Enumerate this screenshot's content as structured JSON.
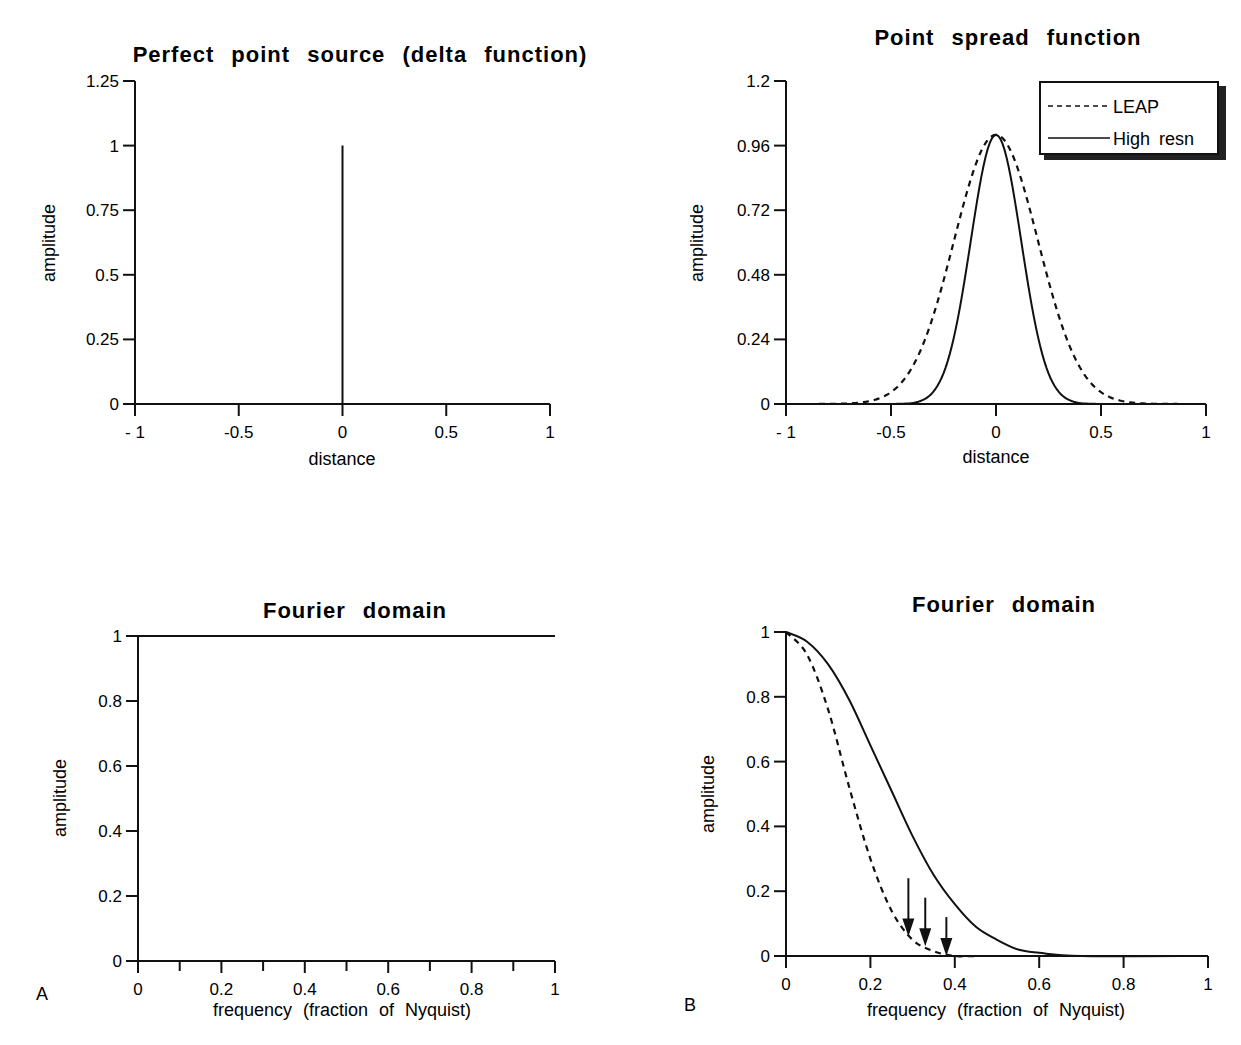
{
  "figure": {
    "panel_labels": [
      "A",
      "B"
    ]
  },
  "chart_data": [
    {
      "id": "A-top",
      "type": "line",
      "title": "Perfect point source (delta function)",
      "xlabel": "distance",
      "ylabel": "amplitude",
      "xlim": [
        -1,
        1
      ],
      "ylim": [
        0,
        1.25
      ],
      "xticks": [
        "- 1",
        "-0.5",
        "0",
        "0.5",
        "1"
      ],
      "yticks": [
        "0",
        "0.25",
        "0.5",
        "0.75",
        "1",
        "1.25"
      ],
      "grid": false,
      "series": [
        {
          "name": "delta",
          "style": "solid",
          "x": [
            -1,
            0,
            0,
            0,
            1
          ],
          "y": [
            0,
            0,
            1,
            0,
            0
          ]
        }
      ]
    },
    {
      "id": "B-top",
      "type": "line",
      "title": "Point spread function",
      "xlabel": "distance",
      "ylabel": "amplitude",
      "xlim": [
        -1,
        1
      ],
      "ylim": [
        0,
        1.2
      ],
      "xticks": [
        "- 1",
        "-0.5",
        "0",
        "0.5",
        "1"
      ],
      "yticks": [
        "0",
        "0.24",
        "0.48",
        "0.72",
        "0.96",
        "1.2"
      ],
      "grid": false,
      "legend": {
        "position": "upper right",
        "entries": [
          {
            "label": "LEAP",
            "style": "dashed"
          },
          {
            "label": "High resn",
            "style": "solid"
          }
        ]
      },
      "series": [
        {
          "name": "LEAP",
          "style": "dashed",
          "gaussian_sigma": 0.2,
          "x": [
            -1,
            -0.6,
            -0.5,
            -0.4,
            -0.3,
            -0.2,
            -0.1,
            0,
            0.1,
            0.2,
            0.3,
            0.4,
            0.5,
            0.6,
            1
          ],
          "y": [
            0,
            0.01,
            0.04,
            0.14,
            0.32,
            0.6,
            0.88,
            1.0,
            0.88,
            0.6,
            0.32,
            0.14,
            0.04,
            0.01,
            0
          ]
        },
        {
          "name": "High resn",
          "style": "solid",
          "gaussian_sigma": 0.12,
          "x": [
            -1,
            -0.4,
            -0.3,
            -0.2,
            -0.1,
            0,
            0.1,
            0.2,
            0.3,
            0.4,
            1
          ],
          "y": [
            0,
            0.0,
            0.04,
            0.25,
            0.7,
            1.0,
            0.7,
            0.25,
            0.04,
            0.0,
            0
          ]
        }
      ]
    },
    {
      "id": "A-bottom",
      "type": "line",
      "title": "Fourier domain",
      "xlabel": "frequency (fraction of Nyquist)",
      "ylabel": "amplitude",
      "xlim": [
        0,
        1
      ],
      "ylim": [
        0,
        1
      ],
      "xticks": [
        "0",
        "0.2",
        "0.4",
        "0.6",
        "0.8",
        "1"
      ],
      "minor_xticks": [
        0.1,
        0.3,
        0.5,
        0.7,
        0.9
      ],
      "yticks": [
        "0",
        "0.2",
        "0.4",
        "0.6",
        "0.8",
        "1"
      ],
      "grid": false,
      "series": [
        {
          "name": "flat",
          "style": "solid",
          "x": [
            0,
            1
          ],
          "y": [
            1,
            1
          ]
        }
      ]
    },
    {
      "id": "B-bottom",
      "type": "line",
      "title": "Fourier domain",
      "xlabel": "frequency (fraction of Nyquist)",
      "ylabel": "amplitude",
      "xlim": [
        0,
        1
      ],
      "ylim": [
        0,
        1
      ],
      "xticks": [
        "0",
        "0.2",
        "0.4",
        "0.6",
        "0.8",
        "1"
      ],
      "yticks": [
        "0",
        "0.2",
        "0.4",
        "0.6",
        "0.8",
        "1"
      ],
      "grid": false,
      "annotations": [
        {
          "type": "arrow",
          "x": 0.29,
          "from_y": 0.24,
          "to_y": 0.06
        },
        {
          "type": "arrow",
          "x": 0.33,
          "from_y": 0.18,
          "to_y": 0.03
        },
        {
          "type": "arrow",
          "x": 0.38,
          "from_y": 0.12,
          "to_y": 0.0
        }
      ],
      "series": [
        {
          "name": "LEAP",
          "style": "dashed",
          "x": [
            0,
            0.05,
            0.1,
            0.15,
            0.2,
            0.25,
            0.3,
            0.35,
            0.4,
            0.45
          ],
          "y": [
            1.0,
            0.93,
            0.76,
            0.52,
            0.3,
            0.14,
            0.05,
            0.015,
            0.0,
            0.0
          ]
        },
        {
          "name": "High resn",
          "style": "solid",
          "x": [
            0,
            0.05,
            0.1,
            0.15,
            0.2,
            0.25,
            0.3,
            0.35,
            0.4,
            0.45,
            0.5,
            0.55,
            0.6,
            0.7,
            1.0
          ],
          "y": [
            1.0,
            0.97,
            0.9,
            0.79,
            0.65,
            0.51,
            0.37,
            0.25,
            0.16,
            0.09,
            0.05,
            0.02,
            0.01,
            0.0,
            0.0
          ]
        }
      ]
    }
  ]
}
